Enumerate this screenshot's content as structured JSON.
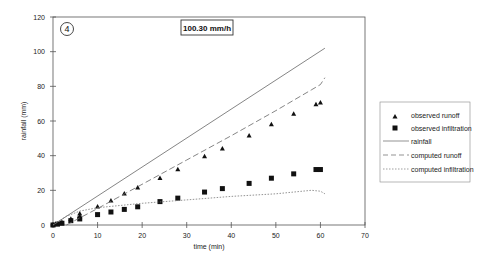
{
  "panel_label": "4",
  "rate_label": "100.30 mm/h",
  "chart_data": {
    "type": "scatter",
    "title": "",
    "annotation": "100.30 mm/h",
    "panel": "4",
    "xlabel": "time (min)",
    "ylabel": "rainfall (mm)",
    "xlim": [
      0,
      70
    ],
    "ylim": [
      0,
      120
    ],
    "xticks": [
      0,
      10,
      20,
      30,
      40,
      50,
      60,
      70
    ],
    "yticks": [
      0,
      20,
      40,
      60,
      80,
      100,
      120
    ],
    "grid": false,
    "legend_position": "right",
    "series": [
      {
        "name": "observed runoff",
        "kind": "scatter",
        "marker": "triangle",
        "points": [
          [
            0,
            0
          ],
          [
            1,
            0.5
          ],
          [
            2,
            1.5
          ],
          [
            4,
            3.5
          ],
          [
            6,
            5
          ],
          [
            6,
            6.5
          ],
          [
            10,
            10.5
          ],
          [
            13,
            14
          ],
          [
            16,
            18
          ],
          [
            19,
            21.5
          ],
          [
            24,
            27
          ],
          [
            28,
            32
          ],
          [
            34,
            39.5
          ],
          [
            38,
            44
          ],
          [
            44,
            51.5
          ],
          [
            49,
            58
          ],
          [
            54,
            64
          ],
          [
            59,
            69.5
          ],
          [
            60,
            70.5
          ]
        ]
      },
      {
        "name": "observed infiltration",
        "kind": "scatter",
        "marker": "square",
        "points": [
          [
            0,
            0
          ],
          [
            1,
            0.5
          ],
          [
            2,
            1
          ],
          [
            4,
            2.5
          ],
          [
            6,
            3.5
          ],
          [
            10,
            6
          ],
          [
            13,
            7.5
          ],
          [
            16,
            9
          ],
          [
            19,
            10.5
          ],
          [
            24,
            13.5
          ],
          [
            28,
            15.5
          ],
          [
            34,
            19
          ],
          [
            38,
            21
          ],
          [
            44,
            24
          ],
          [
            49,
            27
          ],
          [
            54,
            29.5
          ],
          [
            59,
            32
          ],
          [
            60,
            32
          ]
        ]
      },
      {
        "name": "rainfall",
        "kind": "line",
        "style": "solid",
        "points": [
          [
            0,
            0
          ],
          [
            61,
            102
          ]
        ]
      },
      {
        "name": "computed runoff",
        "kind": "line",
        "style": "dashed",
        "points": [
          [
            3,
            0
          ],
          [
            10,
            9.5
          ],
          [
            20,
            23.5
          ],
          [
            30,
            37.5
          ],
          [
            40,
            51.5
          ],
          [
            50,
            66
          ],
          [
            58,
            78
          ],
          [
            60,
            81
          ],
          [
            61,
            85
          ]
        ]
      },
      {
        "name": "computed infiltration",
        "kind": "line",
        "style": "dotted",
        "points": [
          [
            0,
            0
          ],
          [
            3,
            5
          ],
          [
            6,
            8
          ],
          [
            10,
            10
          ],
          [
            20,
            12.5
          ],
          [
            30,
            14.5
          ],
          [
            40,
            16.5
          ],
          [
            50,
            18
          ],
          [
            58,
            20
          ],
          [
            60,
            19.5
          ],
          [
            61,
            18
          ]
        ]
      }
    ]
  },
  "legend": {
    "items": [
      {
        "label": "observed runoff",
        "symbol": "triangle"
      },
      {
        "label": "observed infiltration",
        "symbol": "square"
      },
      {
        "label": "rainfall",
        "symbol": "solid-line"
      },
      {
        "label": "computed runoff",
        "symbol": "dashed-line"
      },
      {
        "label": "computed infiltration",
        "symbol": "dotted-line"
      }
    ]
  }
}
